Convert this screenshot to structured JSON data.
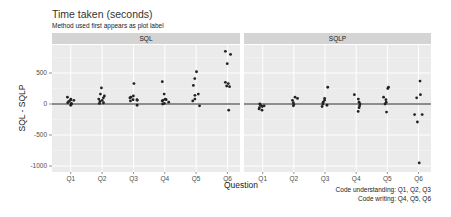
{
  "chart_data": {
    "type": "scatter",
    "title": "Time taken (seconds)",
    "subtitle": "Method used first appears as plot label",
    "xlabel": "Question",
    "ylabel": "SQL - SQLP",
    "ylim": [
      -1050,
      900
    ],
    "yticks": [
      500,
      0,
      -500,
      -1000
    ],
    "ytick_labels": [
      "500",
      "0",
      "-500",
      "-1000"
    ],
    "categories": [
      "Q1",
      "Q2",
      "Q3",
      "Q4",
      "Q5",
      "Q6"
    ],
    "reference_line": 0,
    "grid": true,
    "facets": [
      {
        "label": "SQL",
        "points": {
          "Q1": [
            -20,
            10,
            20,
            40,
            60,
            80,
            110,
            60,
            0
          ],
          "Q2": [
            260,
            160,
            130,
            100,
            80,
            60,
            40,
            20,
            10
          ],
          "Q3": [
            330,
            130,
            110,
            100,
            70,
            60,
            50,
            70,
            -20
          ],
          "Q4": [
            360,
            160,
            80,
            70,
            60,
            50,
            30,
            10,
            0
          ],
          "Q5": [
            520,
            410,
            300,
            160,
            140,
            80,
            50,
            -30
          ],
          "Q6": [
            850,
            800,
            650,
            350,
            330,
            290,
            280,
            -100
          ]
        }
      },
      {
        "label": "SQLP",
        "points": {
          "Q1": [
            0,
            -20,
            -40,
            -60,
            -80,
            -100,
            -30
          ],
          "Q2": [
            110,
            90,
            60,
            20,
            -10,
            -30
          ],
          "Q3": [
            270,
            90,
            60,
            30,
            0,
            -20,
            -40
          ],
          "Q4": [
            150,
            80,
            30,
            0,
            -30,
            -60,
            -120
          ],
          "Q5": [
            270,
            250,
            110,
            70,
            30,
            0,
            -130
          ],
          "Q6": [
            370,
            150,
            100,
            -170,
            -170,
            -290,
            -950
          ]
        }
      }
    ]
  },
  "caption": {
    "line1": "Code understanding: Q1, Q2, Q3",
    "line2": "Code writing: Q4, Q5, Q6"
  }
}
